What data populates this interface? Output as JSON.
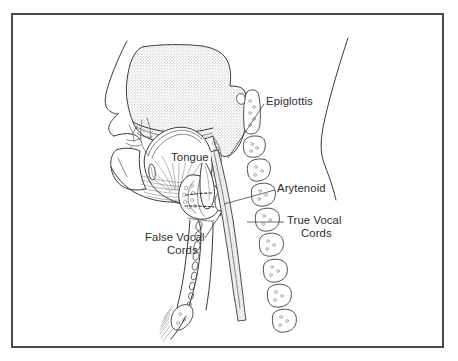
{
  "figure": {
    "border_color": "#4a4a4a",
    "ink_color": "#3a3a3a",
    "text_color": "#2e2e2e",
    "background_color": "#ffffff",
    "stipple_fill_color": "#c9c9c9"
  },
  "labels": {
    "tongue": "Tongue",
    "epiglottis": "Epiglottis",
    "arytenoid": "Arytenoid",
    "true_vocal_cords_line1": "True Vocal",
    "true_vocal_cords_line2": "Cords",
    "false_vocal_cords_line1": "False Vocal",
    "false_vocal_cords_line2": "Cords"
  },
  "structures": [
    {
      "name": "nasal-cavity",
      "shaded": true
    },
    {
      "name": "hard-palate",
      "shaded": false
    },
    {
      "name": "soft-palate",
      "shaded": true
    },
    {
      "name": "tongue",
      "shaded": false
    },
    {
      "name": "mandible",
      "shaded": false
    },
    {
      "name": "lips",
      "shaded": false
    },
    {
      "name": "epiglottis",
      "shaded": false
    },
    {
      "name": "hyoid-bone",
      "shaded": false
    },
    {
      "name": "thyroid-cartilage",
      "shaded": false
    },
    {
      "name": "cricoid-cartilage",
      "shaded": false
    },
    {
      "name": "false-vocal-cords",
      "shaded": false
    },
    {
      "name": "true-vocal-cords",
      "shaded": false
    },
    {
      "name": "arytenoid-cartilage",
      "shaded": false
    },
    {
      "name": "trachea",
      "shaded": false
    },
    {
      "name": "esophagus",
      "shaded": true
    },
    {
      "name": "cervical-vertebrae",
      "shaded": false
    },
    {
      "name": "posterior-neck-contour",
      "shaded": false
    },
    {
      "name": "sternum",
      "shaded": false
    }
  ],
  "vertebrae": {
    "count": 9,
    "note": "Cervical column, odontoid/C2 elongated at top"
  }
}
